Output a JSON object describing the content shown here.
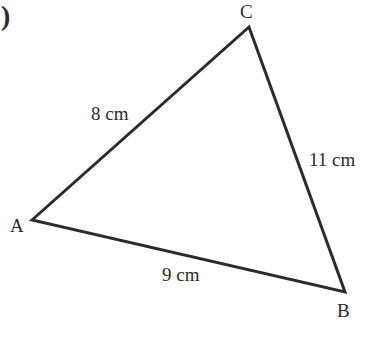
{
  "figure": {
    "part_marker": ")",
    "vertices": [
      {
        "label": "A",
        "x": 32,
        "y": 220
      },
      {
        "label": "B",
        "x": 345,
        "y": 292
      },
      {
        "label": "C",
        "x": 249,
        "y": 27
      }
    ],
    "sides": [
      {
        "between": "AC",
        "label": "8 cm"
      },
      {
        "between": "CB",
        "label": "11 cm"
      },
      {
        "between": "AB",
        "label": "9 cm"
      }
    ],
    "stroke_color": "#2b2b2b"
  }
}
